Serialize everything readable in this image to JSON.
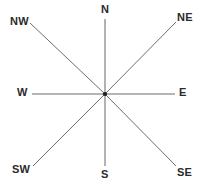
{
  "figure": {
    "name": "compass-rose",
    "width": 204,
    "height": 187,
    "background_color": "#ffffff",
    "line_color": "#6d6d6d",
    "label_color": "#2b2b2b",
    "hub_color": "#1d1d1d",
    "center": {
      "x": 105,
      "y": 94
    }
  },
  "directions": [
    {
      "id": "north",
      "label": "N",
      "abbr": "N",
      "bearing_degrees": 0,
      "line": {
        "x1": 105,
        "y1": 94,
        "x2": 105,
        "y2": 19
      }
    },
    {
      "id": "northeast",
      "label": "NE",
      "abbr": "NE",
      "bearing_degrees": 45,
      "line": {
        "x1": 105,
        "y1": 94,
        "x2": 176,
        "y2": 22
      }
    },
    {
      "id": "east",
      "label": "E",
      "abbr": "E",
      "bearing_degrees": 90,
      "line": {
        "x1": 105,
        "y1": 94,
        "x2": 175,
        "y2": 94
      }
    },
    {
      "id": "southeast",
      "label": "SE",
      "abbr": "SE",
      "bearing_degrees": 135,
      "line": {
        "x1": 105,
        "y1": 94,
        "x2": 176,
        "y2": 166
      }
    },
    {
      "id": "south",
      "label": "S",
      "abbr": "S",
      "bearing_degrees": 180,
      "line": {
        "x1": 105,
        "y1": 94,
        "x2": 105,
        "y2": 166
      }
    },
    {
      "id": "southwest",
      "label": "SW",
      "abbr": "SW",
      "bearing_degrees": 225,
      "line": {
        "x1": 105,
        "y1": 94,
        "x2": 33,
        "y2": 166
      }
    },
    {
      "id": "west",
      "label": "W",
      "abbr": "W",
      "bearing_degrees": 270,
      "line": {
        "x1": 105,
        "y1": 94,
        "x2": 32,
        "y2": 94
      }
    },
    {
      "id": "northwest",
      "label": "NW",
      "abbr": "NW",
      "bearing_degrees": 315,
      "line": {
        "x1": 105,
        "y1": 94,
        "x2": 30,
        "y2": 23
      }
    }
  ]
}
